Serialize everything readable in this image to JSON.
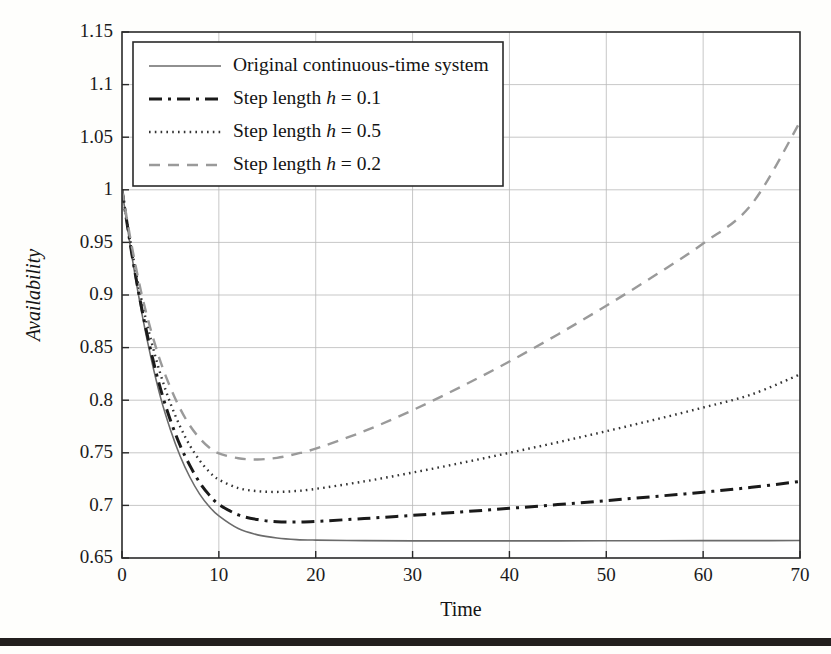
{
  "figure": {
    "background": "#fefefc",
    "bottom_band_color": "#231f1e"
  },
  "axes": {
    "x_title": "Time",
    "y_title": "Availability",
    "x_ticks": [
      "0",
      "10",
      "20",
      "30",
      "40",
      "50",
      "60",
      "70"
    ],
    "y_ticks": [
      "0.65",
      "0.7",
      "0.75",
      "0.8",
      "0.85",
      "0.9",
      "0.95",
      "1",
      "1.05",
      "1.1",
      "1.15"
    ]
  },
  "legend": {
    "items": [
      {
        "label": "Original continuous-time system",
        "label_pre": "Original continuous-time system",
        "label_em": "",
        "label_post": "",
        "style": "solid",
        "color": "#6b6b6b"
      },
      {
        "label": "Step length h = 0.1",
        "label_pre": "Step length ",
        "label_em": "h",
        "label_post": " = 0.1",
        "style": "dashdot",
        "color": "#1a1a1a"
      },
      {
        "label": "Step length h = 0.5",
        "label_pre": "Step length ",
        "label_em": "h",
        "label_post": " = 0.5",
        "style": "dotted",
        "color": "#333333"
      },
      {
        "label": "Step length h = 0.2",
        "label_pre": "Step length ",
        "label_em": "h",
        "label_post": " = 0.2",
        "style": "dashed",
        "color": "#9a9a9a"
      }
    ]
  },
  "chart_data": {
    "type": "line",
    "title": "",
    "xlabel": "Time",
    "ylabel": "Availability",
    "xlim": [
      0,
      70
    ],
    "ylim": [
      0.65,
      1.15
    ],
    "xticks": [
      0,
      10,
      20,
      30,
      40,
      50,
      60,
      70
    ],
    "yticks": [
      0.65,
      0.7,
      0.75,
      0.8,
      0.85,
      0.9,
      0.95,
      1.0,
      1.05,
      1.1,
      1.15
    ],
    "grid": true,
    "legend_position": "upper-left",
    "x": [
      0,
      1,
      2,
      3,
      4,
      5,
      6,
      7,
      8,
      9,
      10,
      12,
      14,
      16,
      18,
      20,
      25,
      30,
      35,
      40,
      45,
      50,
      55,
      60,
      65,
      70
    ],
    "series": [
      {
        "name": "Original continuous-time system",
        "style": "solid",
        "color": "#6b6b6b",
        "width": 1.6,
        "values": [
          1.0,
          0.938,
          0.885,
          0.84,
          0.802,
          0.772,
          0.747,
          0.727,
          0.711,
          0.699,
          0.69,
          0.678,
          0.672,
          0.669,
          0.6675,
          0.667,
          0.6665,
          0.6663,
          0.6663,
          0.6663,
          0.6663,
          0.6664,
          0.6664,
          0.6665,
          0.6665,
          0.6666
        ]
      },
      {
        "name": "Step length h = 0.1",
        "style": "dashdot",
        "color": "#1a1a1a",
        "width": 3.0,
        "values": [
          1.0,
          0.94,
          0.889,
          0.846,
          0.81,
          0.781,
          0.757,
          0.738,
          0.722,
          0.71,
          0.701,
          0.691,
          0.6865,
          0.6845,
          0.6842,
          0.6848,
          0.6875,
          0.6905,
          0.6938,
          0.6972,
          0.7008,
          0.7045,
          0.7085,
          0.7125,
          0.7172,
          0.7228
        ]
      },
      {
        "name": "Step length h = 0.5",
        "style": "dotted",
        "color": "#333333",
        "width": 2.4,
        "values": [
          1.0,
          0.944,
          0.896,
          0.857,
          0.824,
          0.797,
          0.775,
          0.757,
          0.743,
          0.732,
          0.7245,
          0.7165,
          0.7135,
          0.7128,
          0.7137,
          0.7157,
          0.7228,
          0.7312,
          0.7403,
          0.75,
          0.76,
          0.7705,
          0.7815,
          0.793,
          0.8055,
          0.8245
        ]
      },
      {
        "name": "Step length h = 0.2",
        "style": "dashed",
        "color": "#9a9a9a",
        "width": 2.4,
        "values": [
          1.0,
          0.947,
          0.902,
          0.866,
          0.836,
          0.812,
          0.792,
          0.776,
          0.764,
          0.755,
          0.7495,
          0.7448,
          0.7437,
          0.7452,
          0.749,
          0.754,
          0.7705,
          0.7905,
          0.8128,
          0.8368,
          0.8625,
          0.8898,
          0.9185,
          0.949,
          0.9862,
          1.0645
        ]
      }
    ]
  }
}
